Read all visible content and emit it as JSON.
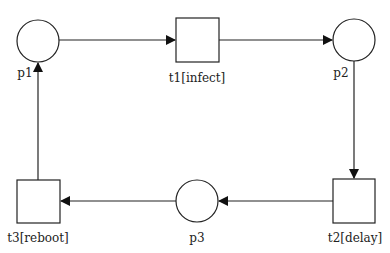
{
  "clipped_caption": "device",
  "places": [
    {
      "id": "p1",
      "label": "p1"
    },
    {
      "id": "p2",
      "label": "p2"
    },
    {
      "id": "p3",
      "label": "p3"
    }
  ],
  "transitions": [
    {
      "id": "t1",
      "label": "t1[infect]"
    },
    {
      "id": "t2",
      "label": "t2[delay]"
    },
    {
      "id": "t3",
      "label": "t3[reboot]"
    }
  ],
  "arcs": [
    {
      "from": "p1",
      "to": "t1"
    },
    {
      "from": "t1",
      "to": "p2"
    },
    {
      "from": "p2",
      "to": "t2"
    },
    {
      "from": "t2",
      "to": "p3"
    },
    {
      "from": "p3",
      "to": "t3"
    },
    {
      "from": "t3",
      "to": "p1"
    }
  ],
  "colors": {
    "stroke": "#222222",
    "background": "#ffffff"
  }
}
